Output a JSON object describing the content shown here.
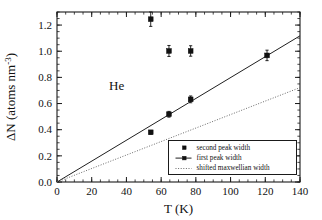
{
  "figure": {
    "background_color": "#ffffff",
    "annotation": "He",
    "annotation_x": 30,
    "annotation_y": 0.7
  },
  "chart_data": {
    "type": "scatter",
    "title": "",
    "subtitle": "",
    "xlabel": "T (K)",
    "ylabel": "ΔN (atoms nm",
    "ylabel_superscript": "-3",
    "ylabel_suffix": ")",
    "xlim": [
      0,
      140
    ],
    "ylim": [
      0.0,
      1.3
    ],
    "grid": false,
    "xticks": [
      0,
      20,
      40,
      60,
      80,
      100,
      120,
      140
    ],
    "xticklabels": [
      "0",
      "20",
      "40",
      "60",
      "80",
      "100",
      "120",
      "140"
    ],
    "yticks": [
      0.0,
      0.2,
      0.4,
      0.6,
      0.8,
      1.0,
      1.2
    ],
    "yticklabels": [
      "0.0",
      "0.2",
      "0.4",
      "0.6",
      "0.8",
      "1.0",
      "1.2"
    ],
    "x_minor_step": 5,
    "y_minor_step": 0.05,
    "legend_position": "lower right",
    "series": [
      {
        "name": "second peak width",
        "marker": "square",
        "style": "points",
        "color": "#111111",
        "points": [
          {
            "x": 54.0,
            "y": 1.245,
            "yerr": 0.055
          },
          {
            "x": 64.5,
            "y": 1.002,
            "yerr": 0.042
          },
          {
            "x": 77.0,
            "y": 1.002,
            "yerr": 0.04
          }
        ]
      },
      {
        "name": "first peak width",
        "marker": "square",
        "style": "points-and-line",
        "color": "#111111",
        "points": [
          {
            "x": 54.0,
            "y": 0.38,
            "yerr": 0.014
          },
          {
            "x": 64.5,
            "y": 0.518,
            "yerr": 0.022
          },
          {
            "x": 77.0,
            "y": 0.632,
            "yerr": 0.026
          },
          {
            "x": 121.0,
            "y": 0.968,
            "yerr": 0.04
          }
        ],
        "fit_line": {
          "x0": 0,
          "y0": 0.0,
          "x1": 140,
          "y1": 1.118
        }
      },
      {
        "name": "shifted  maxwellian  width",
        "marker": "none",
        "style": "dotted-line",
        "color": "#6b6b6b",
        "points": [],
        "fit_line": {
          "x0": 0,
          "y0": 0.0,
          "x1": 140,
          "y1": 0.722
        }
      }
    ],
    "legend_entries": [
      {
        "label": "second  peak  width",
        "symbol": "square"
      },
      {
        "label": "first  peak  width",
        "symbol": "line-square"
      },
      {
        "label": "shifted  maxwellian  width",
        "symbol": "dotted"
      }
    ]
  }
}
